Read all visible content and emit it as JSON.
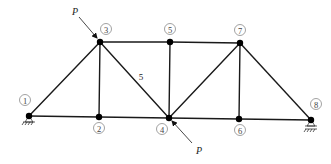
{
  "diagram": {
    "nodes": [
      {
        "id": "1",
        "label": "1",
        "x": 29,
        "y": 116,
        "lx": 25,
        "ly": 100
      },
      {
        "id": "2",
        "label": "2",
        "x": 99,
        "y": 117,
        "lx": 99,
        "ly": 128
      },
      {
        "id": "3",
        "label": "3",
        "x": 100,
        "y": 42,
        "lx": 106,
        "ly": 29
      },
      {
        "id": "4",
        "label": "4",
        "x": 169,
        "y": 118,
        "lx": 162,
        "ly": 129
      },
      {
        "id": "5",
        "label": "5",
        "x": 170,
        "y": 42,
        "lx": 170,
        "ly": 29
      },
      {
        "id": "6",
        "label": "6",
        "x": 239,
        "y": 119,
        "lx": 240,
        "ly": 130
      },
      {
        "id": "7",
        "label": "7",
        "x": 240,
        "y": 43,
        "lx": 240,
        "ly": 30
      },
      {
        "id": "8",
        "label": "8",
        "x": 311,
        "y": 120,
        "lx": 316,
        "ly": 104
      }
    ],
    "members": [
      {
        "from": "1",
        "to": "2"
      },
      {
        "from": "2",
        "to": "4"
      },
      {
        "from": "4",
        "to": "6"
      },
      {
        "from": "6",
        "to": "8"
      },
      {
        "from": "3",
        "to": "5"
      },
      {
        "from": "5",
        "to": "7"
      },
      {
        "from": "1",
        "to": "3"
      },
      {
        "from": "2",
        "to": "3"
      },
      {
        "from": "3",
        "to": "4"
      },
      {
        "from": "4",
        "to": "5"
      },
      {
        "from": "4",
        "to": "7"
      },
      {
        "from": "6",
        "to": "7"
      },
      {
        "from": "7",
        "to": "8"
      }
    ],
    "member_labels": [
      {
        "text": "5",
        "x": 141,
        "y": 77
      }
    ],
    "loads": [
      {
        "name": "P",
        "label": "P",
        "node": "3",
        "x1": 79,
        "y1": 17,
        "x2": 97,
        "y2": 38,
        "lx": 75,
        "ly": 11
      },
      {
        "name": "P",
        "label": "P",
        "node": "4",
        "x1": 192,
        "y1": 143,
        "x2": 172,
        "y2": 121,
        "lx": 199,
        "ly": 150
      }
    ],
    "supports": [
      {
        "node": "1",
        "type": "pin"
      },
      {
        "node": "8",
        "type": "roller"
      }
    ]
  }
}
